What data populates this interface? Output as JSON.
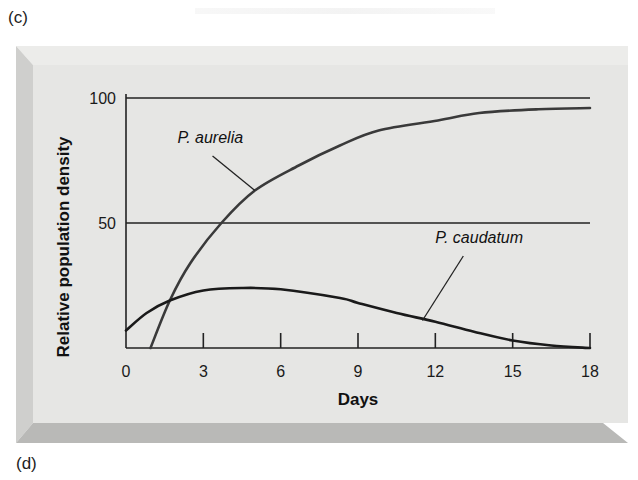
{
  "panel_labels": {
    "top": "(c)",
    "bottom": "(d)"
  },
  "colors": {
    "panel_face": "#e6e6e4",
    "panel_left_bevel": "#cfcfcd",
    "panel_bottom_strip": "#b9b9b7",
    "panel_top_edge": "#ececea",
    "axis": "#222222",
    "aurelia_line": "#3a3a3a",
    "caudatum_line": "#1a1a1a"
  },
  "chart_data": {
    "type": "line",
    "title": "",
    "xlabel": "Days",
    "ylabel": "Relative population density",
    "xlim": [
      0,
      18
    ],
    "ylim": [
      0,
      100
    ],
    "x_ticks": [
      0,
      3,
      6,
      9,
      12,
      15,
      18
    ],
    "x_tick_labels": [
      "0",
      "3",
      "6",
      "9",
      "12",
      "15",
      "18"
    ],
    "y_ticks": [
      50,
      100
    ],
    "y_tick_labels": [
      "50",
      "100"
    ],
    "grid": {
      "horizontal_lines_at": [
        50,
        100
      ]
    },
    "legend": "none (inline labels with leader lines)",
    "series": [
      {
        "name": "P. aurelia",
        "x": [
          0.95,
          1.7,
          2.5,
          3.7,
          5.0,
          6.7,
          8.3,
          9.8,
          12.1,
          13.7,
          16.0,
          18.0
        ],
        "values": [
          0,
          19,
          34,
          50,
          63,
          73,
          81,
          87,
          91,
          94,
          95.5,
          96
        ]
      },
      {
        "name": "P. caudatum",
        "x": [
          0,
          0.8,
          1.7,
          3.0,
          4.5,
          6.0,
          8.3,
          9.0,
          10.5,
          12.0,
          13.5,
          15.0,
          16.5,
          18.0
        ],
        "values": [
          7,
          14,
          19,
          23,
          24,
          23.5,
          20,
          18,
          14,
          10.5,
          6.5,
          3,
          1,
          0
        ]
      }
    ],
    "annotations": [
      {
        "text": "P. aurelia",
        "target_series": "P. aurelia",
        "label_at": [
          2.0,
          82
        ],
        "points_to": [
          5.0,
          63
        ]
      },
      {
        "text": "P. caudatum",
        "target_series": "P. caudatum",
        "label_at": [
          12.0,
          42
        ],
        "points_to": [
          11.5,
          11
        ]
      }
    ]
  }
}
